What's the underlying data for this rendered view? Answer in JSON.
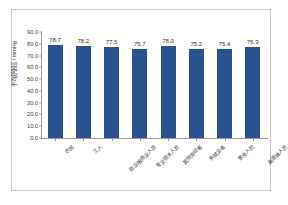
{
  "chart_data": {
    "type": "bar",
    "title": "",
    "xlabel": "",
    "ylabel": "平均舒张压 / mmHg",
    "ylim": [
      0.0,
      90.0
    ],
    "ytick_step": 10.0,
    "grid": false,
    "legend": false,
    "bar_color": "#2a5190",
    "axis_color": "#9a9a9a",
    "frame_color": "#c8c8c8",
    "categories": [
      "农民",
      "工人",
      "商业服务业人员",
      "专业技术人员",
      "其他劳动者",
      "未就业者",
      "家务人员",
      "离退休人员"
    ],
    "values": [
      78.7,
      78.2,
      77.5,
      75.7,
      78.0,
      75.2,
      75.4,
      76.9
    ],
    "value_labels": [
      "78.7",
      "78.2",
      "77.5",
      "75.7",
      "78.0",
      "75.2",
      "75.4",
      "76.9"
    ],
    "ytick_labels": [
      "90.0",
      "80.0",
      "70.0",
      "60.0",
      "50.0",
      "40.0",
      "30.0",
      "20.0",
      "10.0",
      "0.0"
    ],
    "ytick_values": [
      90.0,
      80.0,
      70.0,
      60.0,
      50.0,
      40.0,
      30.0,
      20.0,
      10.0,
      0.0
    ]
  }
}
